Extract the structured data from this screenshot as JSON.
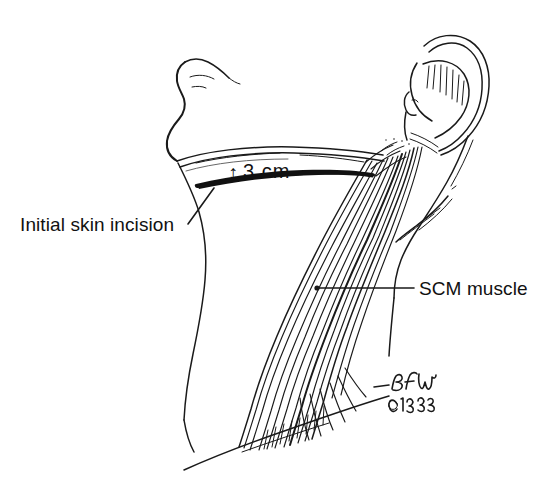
{
  "figure": {
    "background_color": "#ffffff",
    "ink_color": "#1a1a1a",
    "width": 558,
    "height": 497
  },
  "annotations": {
    "incision_label": "Initial skin incision",
    "scm_label": "SCM muscle",
    "dimension": {
      "arrow_glyph": "↕",
      "value": "3",
      "unit": "cm",
      "full": "3 cm"
    }
  },
  "signature": {
    "initials": "BFW",
    "copyright": "©1993"
  },
  "anatomy": {
    "structures": [
      "ear",
      "mandible",
      "chin",
      "anterior neck contour",
      "sternocleidomastoid muscle",
      "clavicle",
      "trapezius border"
    ]
  }
}
